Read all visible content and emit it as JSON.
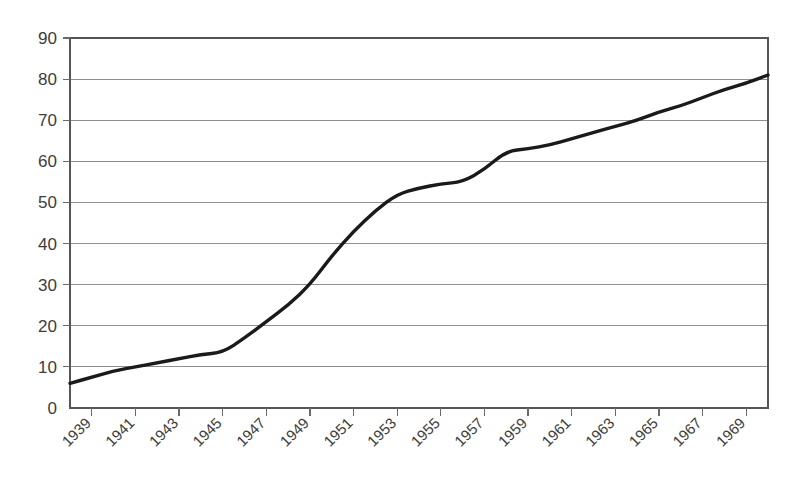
{
  "chart_data": {
    "type": "line",
    "title": "",
    "subtitle": "",
    "xlabel": "",
    "ylabel": "",
    "grid": "horizontal",
    "legend": "none",
    "xlim": [
      1938,
      1970
    ],
    "ylim": [
      0,
      90
    ],
    "ytick_labels": [
      "0",
      "10",
      "20",
      "30",
      "40",
      "50",
      "60",
      "70",
      "80",
      "90"
    ],
    "ytick_values": [
      0,
      10,
      20,
      30,
      40,
      50,
      60,
      70,
      80,
      90
    ],
    "xtick_labels": [
      "1939",
      "1941",
      "1943",
      "1945",
      "1947",
      "1949",
      "1951",
      "1953",
      "1955",
      "1957",
      "1959",
      "1961",
      "1963",
      "1965",
      "1967",
      "1969"
    ],
    "xtick_values": [
      1939,
      1941,
      1943,
      1945,
      1947,
      1949,
      1951,
      1953,
      1955,
      1957,
      1959,
      1961,
      1963,
      1965,
      1967,
      1969
    ],
    "xtick_rotation": 45,
    "x": [
      1938,
      1939,
      1940,
      1941,
      1942,
      1943,
      1944,
      1945,
      1946,
      1947,
      1948,
      1949,
      1950,
      1951,
      1952,
      1953,
      1954,
      1955,
      1956,
      1957,
      1958,
      1959,
      1960,
      1961,
      1962,
      1963,
      1964,
      1965,
      1966,
      1967,
      1968,
      1969,
      1970
    ],
    "values": [
      6,
      7.5,
      9,
      10,
      11,
      12,
      13,
      13.5,
      17,
      21,
      25,
      30,
      37,
      43,
      48,
      52,
      53.5,
      54.5,
      55,
      58,
      62.5,
      63,
      64,
      65.5,
      67,
      68.5,
      70,
      72,
      73.5,
      75.5,
      77.5,
      79,
      81
    ],
    "series": [
      {
        "name": "series-1",
        "color": "#1a1a1a",
        "values": [
          6,
          7.5,
          9,
          10,
          11,
          12,
          13,
          13.5,
          17,
          21,
          25,
          30,
          37,
          43,
          48,
          52,
          53.5,
          54.5,
          55,
          58,
          62.5,
          63,
          64,
          65.5,
          67,
          68.5,
          70,
          72,
          73.5,
          75.5,
          77.5,
          79,
          81
        ]
      }
    ],
    "colors": {
      "background": "#ffffff",
      "line": "#1a1a1a",
      "gridline": "#8f8f8f",
      "frame": "#555555",
      "text": "#3d3d3d"
    }
  }
}
